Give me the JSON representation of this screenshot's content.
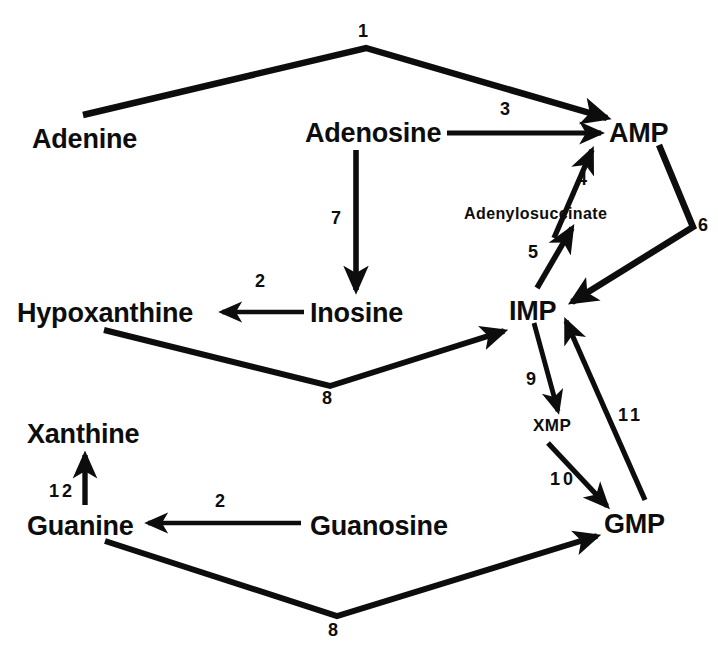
{
  "diagram": {
    "ink_color": "#0d0d0d",
    "background_color": "#ffffff",
    "nodes": [
      {
        "id": "adenine",
        "label": "Adenine",
        "x": 32,
        "y": 126,
        "size": "major"
      },
      {
        "id": "adenosine",
        "label": "Adenosine",
        "x": 305,
        "y": 120,
        "size": "major"
      },
      {
        "id": "amp",
        "label": "AMP",
        "x": 609,
        "y": 120,
        "size": "major"
      },
      {
        "id": "adenylosuccinate",
        "label": "Adenylosuccinate",
        "x": 464,
        "y": 206,
        "size": "minor"
      },
      {
        "id": "hypoxanthine",
        "label": "Hypoxanthine",
        "x": 17,
        "y": 300,
        "size": "major"
      },
      {
        "id": "inosine",
        "label": "Inosine",
        "x": 310,
        "y": 300,
        "size": "major"
      },
      {
        "id": "imp",
        "label": "IMP",
        "x": 509,
        "y": 298,
        "size": "major"
      },
      {
        "id": "xmp",
        "label": "XMP",
        "x": 533,
        "y": 417,
        "size": "small"
      },
      {
        "id": "xanthine",
        "label": "Xanthine",
        "x": 27,
        "y": 421,
        "size": "major"
      },
      {
        "id": "guanine",
        "label": "Guanine",
        "x": 27,
        "y": 513,
        "size": "major"
      },
      {
        "id": "guanosine",
        "label": "Guanosine",
        "x": 310,
        "y": 513,
        "size": "major"
      },
      {
        "id": "gmp",
        "label": "GMP",
        "x": 604,
        "y": 511,
        "size": "major"
      }
    ],
    "edge_labels": [
      {
        "id": "step-1",
        "label": "1",
        "x": 358,
        "y": 22,
        "wide": false
      },
      {
        "id": "step-3",
        "label": "3",
        "x": 500,
        "y": 100,
        "wide": false
      },
      {
        "id": "step-4",
        "label": "4",
        "x": 577,
        "y": 170,
        "wide": false
      },
      {
        "id": "step-6",
        "label": "6",
        "x": 698,
        "y": 216,
        "wide": false
      },
      {
        "id": "step-7",
        "label": "7",
        "x": 331,
        "y": 209,
        "wide": false
      },
      {
        "id": "step-5",
        "label": "5",
        "x": 528,
        "y": 243,
        "wide": false
      },
      {
        "id": "step-2-inosine",
        "label": "2",
        "x": 255,
        "y": 272,
        "wide": false
      },
      {
        "id": "step-9",
        "label": "9",
        "x": 526,
        "y": 370,
        "wide": false
      },
      {
        "id": "step-11",
        "label": "11",
        "x": 618,
        "y": 406,
        "wide": true
      },
      {
        "id": "step-8-upper",
        "label": "8",
        "x": 322,
        "y": 389,
        "wide": false
      },
      {
        "id": "step-10",
        "label": "10",
        "x": 550,
        "y": 470,
        "wide": true
      },
      {
        "id": "step-12",
        "label": "12",
        "x": 49,
        "y": 482,
        "wide": true
      },
      {
        "id": "step-2-guanosine",
        "label": "2",
        "x": 215,
        "y": 492,
        "wide": false
      },
      {
        "id": "step-8-lower",
        "label": "8",
        "x": 328,
        "y": 621,
        "wide": false
      }
    ],
    "edges": [
      {
        "id": "edge-1-adenine-adenosine-to-amp",
        "from": "adenine/adenosine",
        "to": "amp",
        "step": "1"
      },
      {
        "id": "edge-3-adenosine-to-amp",
        "from": "adenosine",
        "to": "amp",
        "step": "3"
      },
      {
        "id": "edge-4-adenylosuccinate-to-amp",
        "from": "adenylosuccinate",
        "to": "amp",
        "step": "4"
      },
      {
        "id": "edge-6-amp-to-imp",
        "from": "amp",
        "to": "imp",
        "step": "6"
      },
      {
        "id": "edge-7-adenosine-to-inosine",
        "from": "adenosine",
        "to": "inosine",
        "step": "7"
      },
      {
        "id": "edge-5-imp-to-adenylosuccinate",
        "from": "imp",
        "to": "adenylosuccinate",
        "step": "5"
      },
      {
        "id": "edge-2-inosine-to-hypoxanthine",
        "from": "inosine",
        "to": "hypoxanthine",
        "step": "2"
      },
      {
        "id": "edge-8-hypoxanthine-to-imp",
        "from": "hypoxanthine",
        "to": "imp",
        "step": "8"
      },
      {
        "id": "edge-9-imp-to-xmp",
        "from": "imp",
        "to": "xmp",
        "step": "9"
      },
      {
        "id": "edge-10-xmp-to-gmp",
        "from": "xmp",
        "to": "gmp",
        "step": "10"
      },
      {
        "id": "edge-11-gmp-to-imp",
        "from": "gmp",
        "to": "imp",
        "step": "11"
      },
      {
        "id": "edge-12-guanine-to-xanthine",
        "from": "guanine",
        "to": "xanthine",
        "step": "12"
      },
      {
        "id": "edge-2-guanosine-to-guanine",
        "from": "guanosine",
        "to": "guanine",
        "step": "2"
      },
      {
        "id": "edge-8-guanine-to-gmp",
        "from": "guanine",
        "to": "gmp",
        "step": "8"
      }
    ]
  }
}
